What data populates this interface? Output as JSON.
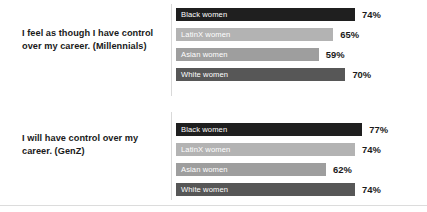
{
  "chart_data": {
    "type": "bar",
    "orientation": "horizontal",
    "title": "",
    "xlabel": "",
    "ylabel": "",
    "xlim": [
      0,
      100
    ],
    "grid": false,
    "legend": "none",
    "value_suffix": "%",
    "categories": [
      "Black women",
      "LatinX women",
      "Asian women",
      "White women"
    ],
    "panels": [
      {
        "question": "I feel as though I have control over my career. (Millennials)",
        "categories": [
          "Black women",
          "LatinX women",
          "Asian women",
          "White women"
        ],
        "values": [
          74,
          65,
          59,
          70
        ],
        "value_labels": [
          "74%",
          "65%",
          "59%",
          "70%"
        ]
      },
      {
        "question": "I will have control over my career. (GenZ)",
        "categories": [
          "Black women",
          "LatinX women",
          "Asian women",
          "White women"
        ],
        "values": [
          77,
          74,
          62,
          74
        ],
        "value_labels": [
          "77%",
          "74%",
          "62%",
          "74%"
        ]
      }
    ]
  },
  "panels": [
    {
      "question": "I feel as though I have control over my career. (Millennials)",
      "bars": [
        {
          "label": "Black women",
          "value": 74,
          "value_label": "74%",
          "color": "#1f1f1f"
        },
        {
          "label": "LatinX women",
          "value": 65,
          "value_label": "65%",
          "color": "#b3b3b3"
        },
        {
          "label": "Asian women",
          "value": 59,
          "value_label": "59%",
          "color": "#9e9e9e"
        },
        {
          "label": "White women",
          "value": 70,
          "value_label": "70%",
          "color": "#575757"
        }
      ]
    },
    {
      "question": "I will have control over my career. (GenZ)",
      "bars": [
        {
          "label": "Black women",
          "value": 77,
          "value_label": "77%",
          "color": "#1f1f1f"
        },
        {
          "label": "LatinX women",
          "value": 74,
          "value_label": "74%",
          "color": "#b3b3b3"
        },
        {
          "label": "Asian women",
          "value": 62,
          "value_label": "62%",
          "color": "#9e9e9e"
        },
        {
          "label": "White women",
          "value": 74,
          "value_label": "74%",
          "color": "#575757"
        }
      ]
    }
  ],
  "layout": {
    "bar_scale_px_per_percent": 2.42,
    "bar_height_px": 13,
    "row_pitch_px": 20,
    "first_row_top_top_panel": 8,
    "first_row_top_bottom_panel": 13,
    "value_gap_px": 7
  }
}
